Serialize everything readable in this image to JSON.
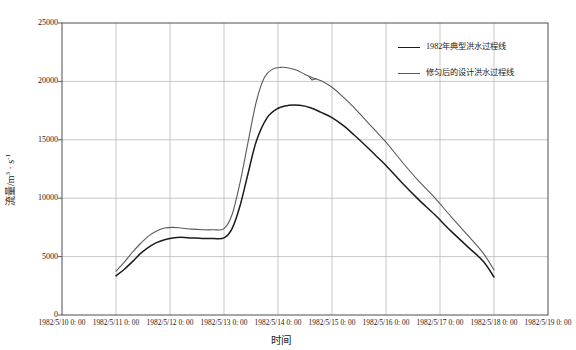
{
  "chart_data": {
    "type": "line",
    "title": "",
    "xlabel": "时间",
    "ylabel": "流量/m3 · s-1",
    "ylabel_parts": {
      "prefix": "流量/m",
      "unit_sup1": "3",
      "middle": " · s",
      "unit_sup2": "-1"
    },
    "grid": true,
    "legend_position": "top-right",
    "ylim": [
      0,
      25000
    ],
    "yticks": [
      0,
      5000,
      10000,
      15000,
      20000,
      25000
    ],
    "ytick_labels": [
      "0",
      "5000",
      "10000",
      "15000",
      "20000",
      "25000"
    ],
    "xlim": [
      "1982/5/10 0: 00",
      "1982/5/19 0: 00"
    ],
    "xticks": [
      "1982/5/10 0: 00",
      "1982/5/11 0: 00",
      "1982/5/12 0: 00",
      "1982/5/13 0: 00",
      "1982/5/14 0: 00",
      "1982/5/15 0: 00",
      "1982/5/16 0: 00",
      "1982/5/17 0: 00",
      "1982/5/18 0: 00",
      "1982/5/19 0: 00"
    ],
    "x_unit": "days since 1982/5/10 0:00",
    "series": [
      {
        "name": "1982年典型洪水过程线",
        "color": "#1c1c1c",
        "width": 1.5,
        "x": [
          1.0,
          1.15,
          1.3,
          1.45,
          1.6,
          1.75,
          1.9,
          2.05,
          2.2,
          2.4,
          2.6,
          2.8,
          3.0,
          3.15,
          3.3,
          3.45,
          3.6,
          3.8,
          4.0,
          4.2,
          4.4,
          4.6,
          4.8,
          5.0,
          5.2,
          5.4,
          5.6,
          5.8,
          6.0,
          6.3,
          6.6,
          6.9,
          7.2,
          7.5,
          7.8,
          8.0
        ],
        "y": [
          3350,
          3900,
          4550,
          5250,
          5800,
          6200,
          6450,
          6600,
          6650,
          6600,
          6550,
          6550,
          6600,
          7400,
          9400,
          12200,
          14900,
          16900,
          17700,
          17950,
          17950,
          17750,
          17350,
          16900,
          16250,
          15450,
          14600,
          13700,
          12800,
          11300,
          9900,
          8600,
          7200,
          5900,
          4600,
          3250
        ]
      },
      {
        "name": "修匀后的设计洪水过程线",
        "color": "#5a5a5a",
        "width": 1.1,
        "x": [
          1.0,
          1.15,
          1.3,
          1.45,
          1.6,
          1.75,
          1.9,
          2.05,
          2.2,
          2.4,
          2.6,
          2.8,
          3.0,
          3.15,
          3.3,
          3.45,
          3.6,
          3.75,
          3.9,
          4.05,
          4.2,
          4.35,
          4.5,
          4.65,
          4.8,
          5.0,
          5.2,
          5.4,
          5.6,
          5.8,
          6.0,
          6.3,
          6.6,
          6.9,
          7.2,
          7.5,
          7.8,
          8.0
        ],
        "y": [
          3750,
          4500,
          5350,
          6100,
          6750,
          7200,
          7450,
          7500,
          7450,
          7350,
          7300,
          7300,
          7400,
          8600,
          11400,
          14900,
          18300,
          20350,
          21050,
          21200,
          21150,
          20950,
          20600,
          20300,
          20050,
          19500,
          18700,
          17800,
          16800,
          15800,
          14800,
          13100,
          11500,
          10050,
          8450,
          6900,
          5300,
          3850
        ]
      }
    ],
    "annotations": [
      {
        "type": "kink",
        "series": "修匀后的设计洪水过程线",
        "x": 4.6,
        "note": "small notch in smoothed design curve near 1982/5/14"
      }
    ]
  },
  "legend": {
    "items": [
      {
        "label": "1982年典型洪水过程线",
        "color": "#1c1c1c"
      },
      {
        "label": "修匀后的设计洪水过程线",
        "color": "#5a5a5a"
      }
    ]
  },
  "axes": {
    "x_title": "时间",
    "y_title_prefix": "流量/m",
    "y_title_sup1": "3",
    "y_title_middle": " · s",
    "y_title_sup2": "-1"
  },
  "colors": {
    "grid": "#b9b9b9",
    "axis": "#4f4f4f",
    "background": "#ffffff",
    "text": "#1a1a1a"
  }
}
